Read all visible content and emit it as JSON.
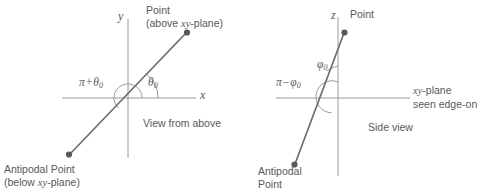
{
  "figure": {
    "stroke_color": "#58595b",
    "axis_color": "#9a9a9a",
    "background": "#ffffff"
  },
  "left_panel": {
    "caption": "View from above",
    "axis_x_label": "x",
    "axis_y_label": "y",
    "point_label_line1": "Point",
    "point_label_line2_prefix": "(above ",
    "point_label_line2_math": "xy",
    "point_label_line2_suffix": "-plane)",
    "antipodal_label_line1": "Antipodal Point",
    "antipodal_label_line2_prefix": "(below ",
    "antipodal_label_line2_math": "xy",
    "antipodal_label_line2_suffix": "-plane)",
    "angle_small": "θ",
    "angle_small_sub": "0",
    "angle_large_first": "π",
    "angle_large_op": "+",
    "angle_large_second": "θ",
    "angle_large_sub": "0"
  },
  "right_panel": {
    "caption": "Side view",
    "axis_z_label": "z",
    "plane_label_math": "xy",
    "plane_label_line1_suffix": "-plane",
    "plane_label_line2": "seen edge-on",
    "point_label": "Point",
    "antipodal_label_line1": "Antipodal",
    "antipodal_label_line2": "Point",
    "angle_small": "φ",
    "angle_small_sub": "0",
    "angle_large_first": "π",
    "angle_large_op": "−",
    "angle_large_second": "φ",
    "angle_large_sub": "0"
  }
}
